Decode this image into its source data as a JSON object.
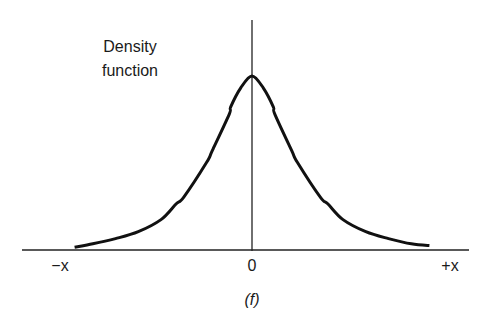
{
  "chart_data": {
    "type": "line",
    "title": "",
    "ylabel": "Density function",
    "xlabel": "",
    "caption": "(f)",
    "distribution": "symmetric heavy-tailed (Cauchy-like) density centered at 0",
    "x_ticks": [
      "−x",
      "0",
      "+x"
    ],
    "xlim": [
      -3.9,
      3.9
    ],
    "ylim": [
      0,
      1.0
    ],
    "series": [
      {
        "name": "density",
        "x": [
          -3.9,
          -3.5,
          -3.0,
          -2.5,
          -2.0,
          -1.67,
          -1.5,
          -1.0,
          -0.87,
          -0.5,
          -0.47,
          -0.25,
          0,
          0.25,
          0.47,
          0.5,
          0.87,
          1.0,
          1.5,
          1.67,
          2.0,
          2.5,
          3.0,
          3.5,
          3.9
        ],
        "y": [
          0.01,
          0.03,
          0.06,
          0.1,
          0.17,
          0.26,
          0.3,
          0.5,
          0.57,
          0.78,
          0.82,
          0.93,
          1.0,
          0.93,
          0.82,
          0.78,
          0.57,
          0.5,
          0.3,
          0.26,
          0.17,
          0.1,
          0.06,
          0.03,
          0.02
        ]
      }
    ],
    "grid": false,
    "legend": "none",
    "colors": {
      "curve": "#111111",
      "axes": "#222222",
      "text": "#1a1a1a"
    }
  }
}
